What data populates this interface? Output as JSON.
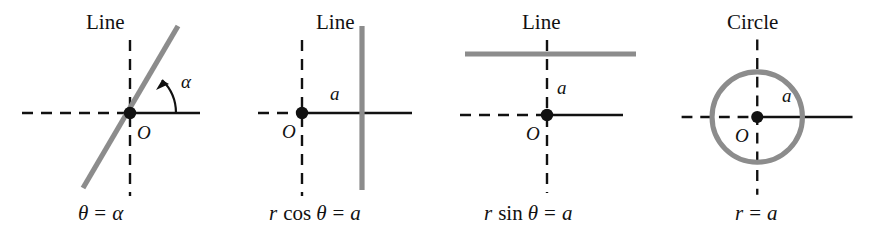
{
  "figure": {
    "background": "#ffffff",
    "curve_color": "#8c8c8c",
    "axis_color": "#111111",
    "text_color": "#111111",
    "width": 886,
    "height": 238
  },
  "panels": [
    {
      "id": "panel-1",
      "title": "Line",
      "equation_parts": {
        "lhs": "θ",
        "eq": "=",
        "rhs": "α"
      },
      "equation": "θ = α",
      "origin_label": "O",
      "angle_label": "α",
      "dim_label": "",
      "shape": "slanted-line",
      "description": "Line through the origin at angle alpha from the polar axis"
    },
    {
      "id": "panel-2",
      "title": "Line",
      "equation_parts": {
        "lhs": "r",
        "fn": "cos",
        "var": "θ",
        "eq": "=",
        "rhs": "a"
      },
      "equation": "r cos θ = a",
      "origin_label": "O",
      "angle_label": "",
      "dim_label": "a",
      "shape": "vertical-line",
      "description": "Vertical line at horizontal distance a to the right of the origin"
    },
    {
      "id": "panel-3",
      "title": "Line",
      "equation_parts": {
        "lhs": "r",
        "fn": "sin",
        "var": "θ",
        "eq": "=",
        "rhs": "a"
      },
      "equation": "r sin θ = a",
      "origin_label": "O",
      "angle_label": "",
      "dim_label": "a",
      "shape": "horizontal-line",
      "description": "Horizontal line at vertical distance a above the origin"
    },
    {
      "id": "panel-4",
      "title": "Circle",
      "equation_parts": {
        "lhs": "r",
        "eq": "=",
        "rhs": "a"
      },
      "equation": "r = a",
      "origin_label": "O",
      "angle_label": "",
      "dim_label": "a",
      "shape": "circle",
      "description": "Circle of radius a centered at the origin"
    }
  ]
}
